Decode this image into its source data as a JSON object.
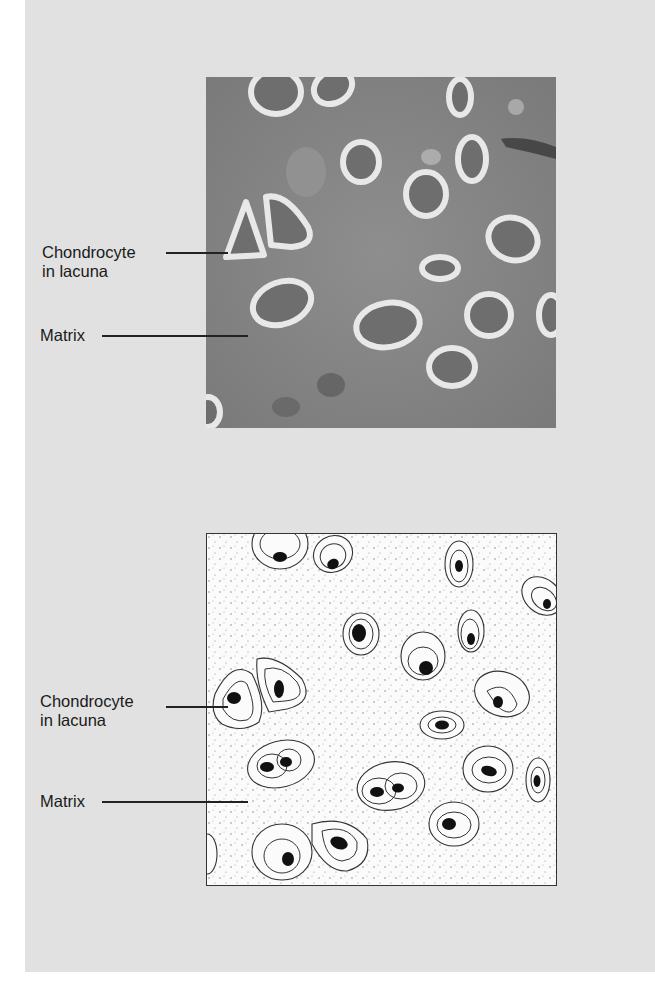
{
  "figure": {
    "top_panel": {
      "type": "micrograph",
      "labels": [
        {
          "text_line1": "Chondrocyte",
          "text_line2": "in lacuna"
        },
        {
          "text_line1": "Matrix"
        }
      ]
    },
    "bottom_panel": {
      "type": "line-drawing",
      "labels": [
        {
          "text_line1": "Chondrocyte",
          "text_line2": "in lacuna"
        },
        {
          "text_line1": "Matrix"
        }
      ]
    }
  },
  "colors": {
    "panel_bg": "#e1e1e1",
    "photo_matrix": "#8a8a8a",
    "drawing_bg": "#fbfbfb",
    "ink": "#222222"
  }
}
